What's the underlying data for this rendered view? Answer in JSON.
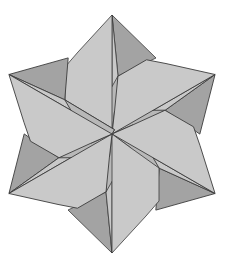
{
  "figure": {
    "title": "",
    "width": 225,
    "height": 266,
    "center": [
      112,
      134
    ],
    "symmetry": 6,
    "rotation_start_deg": 0
  },
  "colors": {
    "background": "#ffffff",
    "light": "#c9c9c9",
    "mid": "#b8b8b8",
    "dark": "#a3a3a3",
    "edge": "#3a3a3a"
  },
  "sector": {
    "light_petal": [
      [
        0,
        -119
      ],
      [
        -34,
        -82
      ],
      [
        -47,
        -67
      ],
      [
        -47,
        -34
      ],
      [
        -19,
        -14
      ],
      [
        0,
        0
      ]
    ],
    "light_strip": [
      [
        0,
        -119
      ],
      [
        6,
        -58
      ],
      [
        5,
        0
      ],
      [
        0,
        0
      ]
    ],
    "mid_wedge": [
      [
        6,
        -58
      ],
      [
        -19,
        -14
      ],
      [
        0,
        0
      ],
      [
        5,
        0
      ]
    ],
    "dark_flap": [
      [
        0,
        -119
      ],
      [
        44,
        -76
      ],
      [
        6,
        -58
      ]
    ]
  }
}
